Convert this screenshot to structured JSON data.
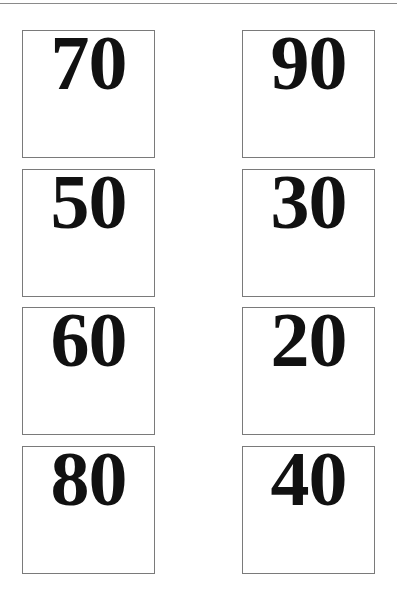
{
  "cards": [
    {
      "value": "70",
      "col": 0,
      "row": 0
    },
    {
      "value": "90",
      "col": 1,
      "row": 0
    },
    {
      "value": "50",
      "col": 0,
      "row": 1
    },
    {
      "value": "30",
      "col": 1,
      "row": 1
    },
    {
      "value": "60",
      "col": 0,
      "row": 2
    },
    {
      "value": "20",
      "col": 1,
      "row": 2
    },
    {
      "value": "80",
      "col": 0,
      "row": 3
    },
    {
      "value": "40",
      "col": 1,
      "row": 3
    }
  ]
}
